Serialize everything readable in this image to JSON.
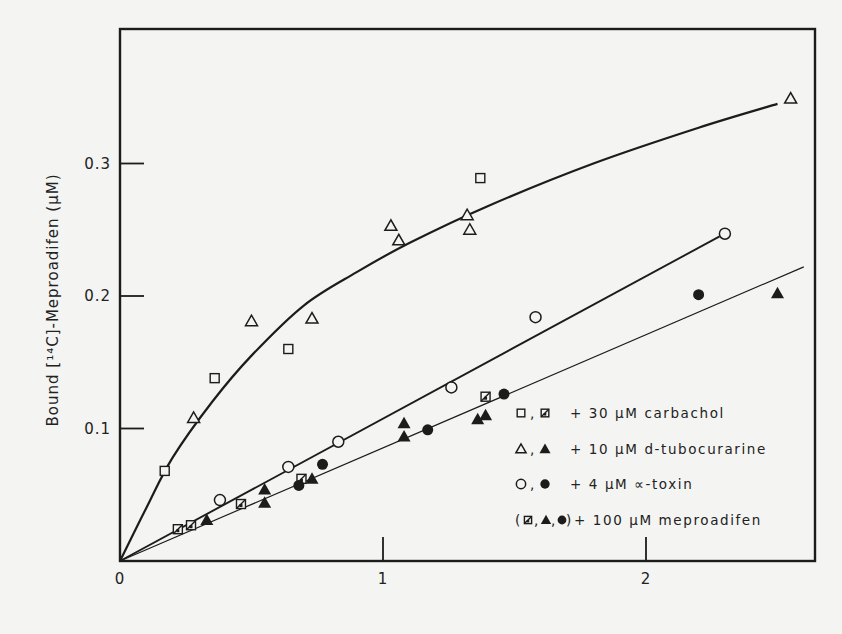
{
  "chart_data": {
    "type": "scatter",
    "title": "",
    "xlabel": "",
    "ylabel": "Bound [¹⁴C]-Meproadifen (μM)",
    "xlim": [
      0,
      2.65
    ],
    "ylim": [
      0,
      0.36
    ],
    "x_ticks": [
      {
        "value": 0,
        "label": "0"
      },
      {
        "value": 1,
        "label": "1"
      },
      {
        "value": 2,
        "label": "2"
      }
    ],
    "y_ticks": [
      {
        "value": 0.1,
        "label": "0.1"
      },
      {
        "value": 0.2,
        "label": "0.2"
      },
      {
        "value": 0.3,
        "label": "0.3"
      }
    ],
    "grid": false,
    "legend_position": "lower right (inside)",
    "legend": [
      {
        "symbols": "□ , ▧",
        "text": "+ 30 μM carbachol"
      },
      {
        "symbols": "△ , ▲",
        "text": "+ 10 μM d-tubocurarine"
      },
      {
        "symbols": "○ , ●",
        "text": "+ 4  μM ∝-toxin"
      },
      {
        "symbols": "(▧, ▲, ●)",
        "text": "+ 100 μM meproadifen"
      }
    ],
    "series": [
      {
        "name": "30 μM carbachol",
        "marker": "open-square",
        "points": [
          [
            0.17,
            0.068
          ],
          [
            0.36,
            0.138
          ],
          [
            0.64,
            0.16
          ],
          [
            1.37,
            0.289
          ]
        ]
      },
      {
        "name": "10 μM d-tubocurarine",
        "marker": "open-triangle",
        "points": [
          [
            0.28,
            0.108
          ],
          [
            0.5,
            0.181
          ],
          [
            0.73,
            0.183
          ],
          [
            1.03,
            0.253
          ],
          [
            1.06,
            0.242
          ],
          [
            1.32,
            0.261
          ],
          [
            1.33,
            0.25
          ],
          [
            2.55,
            0.349
          ]
        ]
      },
      {
        "name": "4 μM α-toxin",
        "marker": "open-circle",
        "points": [
          [
            0.38,
            0.046
          ],
          [
            0.64,
            0.071
          ],
          [
            0.83,
            0.09
          ],
          [
            1.26,
            0.131
          ],
          [
            1.58,
            0.184
          ],
          [
            2.3,
            0.247
          ]
        ]
      },
      {
        "name": "30 μM carbachol + 100 μM meproadifen",
        "marker": "crossed-square",
        "points": [
          [
            0.22,
            0.024
          ],
          [
            0.27,
            0.027
          ],
          [
            0.46,
            0.043
          ],
          [
            0.69,
            0.062
          ],
          [
            1.39,
            0.124
          ]
        ]
      },
      {
        "name": "10 μM d-tubocurarine + 100 μM meproadifen",
        "marker": "filled-triangle",
        "points": [
          [
            0.33,
            0.031
          ],
          [
            0.55,
            0.054
          ],
          [
            0.55,
            0.044
          ],
          [
            0.73,
            0.062
          ],
          [
            1.08,
            0.104
          ],
          [
            1.08,
            0.094
          ],
          [
            1.36,
            0.107
          ],
          [
            1.39,
            0.11
          ],
          [
            2.5,
            0.202
          ]
        ]
      },
      {
        "name": "4 μM α-toxin + 100 μM meproadifen",
        "marker": "filled-circle",
        "points": [
          [
            0.68,
            0.057
          ],
          [
            0.77,
            0.073
          ],
          [
            1.17,
            0.099
          ],
          [
            1.46,
            0.126
          ],
          [
            2.2,
            0.201
          ]
        ]
      }
    ],
    "curves": [
      {
        "name": "carbachol/d-tubocurarine fit (hyperbolic)",
        "style": "thick",
        "points": [
          [
            0,
            0
          ],
          [
            0.1,
            0.04
          ],
          [
            0.2,
            0.078
          ],
          [
            0.35,
            0.12
          ],
          [
            0.5,
            0.155
          ],
          [
            0.7,
            0.193
          ],
          [
            0.9,
            0.218
          ],
          [
            1.1,
            0.24
          ],
          [
            1.4,
            0.268
          ],
          [
            1.8,
            0.3
          ],
          [
            2.2,
            0.327
          ],
          [
            2.5,
            0.345
          ]
        ]
      },
      {
        "name": "α-toxin fit (linear)",
        "style": "medium",
        "points": [
          [
            0,
            0
          ],
          [
            2.28,
            0.245
          ]
        ]
      },
      {
        "name": "+100 μM meproadifen fit (linear)",
        "style": "thin",
        "points": [
          [
            0,
            0
          ],
          [
            2.6,
            0.222
          ]
        ]
      }
    ]
  }
}
